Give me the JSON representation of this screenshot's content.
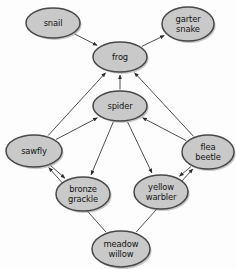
{
  "diagram": {
    "type": "directed-graph",
    "background_color": "#fdfdfd",
    "node_fill_color": "#c9c9c9",
    "node_border_color": "#484848",
    "edge_color": "#3a3a3a",
    "label_color": "#141414"
  },
  "nodes": [
    {
      "id": "snail",
      "lines": [
        "snail"
      ],
      "cx": 53,
      "cy": 23,
      "rx": 27,
      "ry": 15
    },
    {
      "id": "garter_snake",
      "lines": [
        "garter",
        "snake"
      ],
      "cx": 188,
      "cy": 24,
      "rx": 26,
      "ry": 17
    },
    {
      "id": "frog",
      "lines": [
        "frog"
      ],
      "cx": 120,
      "cy": 57,
      "rx": 27,
      "ry": 15
    },
    {
      "id": "spider",
      "lines": [
        "spider"
      ],
      "cx": 120,
      "cy": 106,
      "rx": 27,
      "ry": 15
    },
    {
      "id": "sawfly",
      "lines": [
        "sawfly"
      ],
      "cx": 34,
      "cy": 151,
      "rx": 28,
      "ry": 16
    },
    {
      "id": "flea_beetle",
      "lines": [
        "flea",
        "beetle"
      ],
      "cx": 208,
      "cy": 152,
      "rx": 26,
      "ry": 17
    },
    {
      "id": "bronze_grackle",
      "lines": [
        "bronze",
        "grackle"
      ],
      "cx": 83,
      "cy": 194,
      "rx": 27,
      "ry": 17
    },
    {
      "id": "yellow_warbler",
      "lines": [
        "yellow",
        "warbler"
      ],
      "cx": 161,
      "cy": 192,
      "rx": 27,
      "ry": 17
    },
    {
      "id": "meadow_willow",
      "lines": [
        "meadow",
        "willow"
      ],
      "cx": 121,
      "cy": 249,
      "rx": 29,
      "ry": 18
    }
  ],
  "edges": [
    {
      "from": "snail",
      "to": "frog"
    },
    {
      "from": "frog",
      "to": "garter_snake"
    },
    {
      "from": "spider",
      "to": "frog"
    },
    {
      "from": "sawfly",
      "to": "frog"
    },
    {
      "from": "flea_beetle",
      "to": "frog"
    },
    {
      "from": "sawfly",
      "to": "spider"
    },
    {
      "from": "flea_beetle",
      "to": "spider"
    },
    {
      "from": "spider",
      "to": "bronze_grackle"
    },
    {
      "from": "spider",
      "to": "yellow_warbler"
    },
    {
      "from": "sawfly",
      "to": "bronze_grackle"
    },
    {
      "from": "flea_beetle",
      "to": "yellow_warbler"
    },
    {
      "from": "meadow_willow",
      "to": "sawfly"
    },
    {
      "from": "meadow_willow",
      "to": "flea_beetle"
    }
  ]
}
